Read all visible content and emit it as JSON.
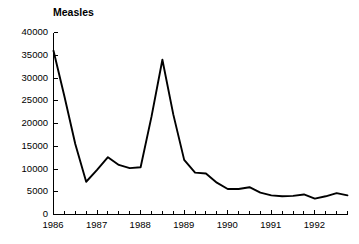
{
  "chart_data": {
    "type": "line",
    "title": "Measles",
    "xlabel": "",
    "ylabel": "",
    "ylim": [
      0,
      40000
    ],
    "xlim": [
      1986,
      1992.75
    ],
    "grid": false,
    "legend": "none",
    "y_ticks": [
      0,
      5000,
      10000,
      15000,
      20000,
      25000,
      30000,
      35000,
      40000
    ],
    "y_tick_labels": [
      "0",
      "5000",
      "10000",
      "15000",
      "20000",
      "25000",
      "30000",
      "35000",
      "40000"
    ],
    "x_ticks": [
      1986,
      1987,
      1988,
      1989,
      1990,
      1991,
      1992
    ],
    "x_tick_labels": [
      "1986",
      "1987",
      "1988",
      "1989",
      "1990",
      "1991",
      "1992"
    ],
    "x_minor_tick_interval": 0.25,
    "series": [
      {
        "name": "Measles cases",
        "color": "#000000",
        "x": [
          1986.0,
          1986.25,
          1986.5,
          1986.75,
          1987.0,
          1987.25,
          1987.5,
          1987.75,
          1988.0,
          1988.25,
          1988.5,
          1988.75,
          1989.0,
          1989.25,
          1989.5,
          1989.75,
          1990.0,
          1990.25,
          1990.5,
          1990.75,
          1991.0,
          1991.25,
          1991.5,
          1991.75,
          1992.0,
          1992.25,
          1992.5,
          1992.75
        ],
        "values": [
          36000,
          26000,
          15500,
          7200,
          9800,
          12600,
          10900,
          10200,
          10400,
          21500,
          34000,
          22000,
          12000,
          9200,
          9000,
          7000,
          5600,
          5600,
          6000,
          4800,
          4200,
          4000,
          4100,
          4400,
          3500,
          4000,
          4700,
          4200
        ]
      }
    ]
  }
}
